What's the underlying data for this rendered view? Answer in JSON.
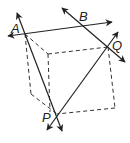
{
  "diagram": {
    "type": "geometry-cube-lines",
    "stroke_color": "#222222",
    "background": "#ffffff",
    "points": {
      "A": {
        "label": "A",
        "x": 25,
        "y": 34
      },
      "B": {
        "label": "B",
        "x": 80,
        "y": 27
      },
      "Q": {
        "label": "Q",
        "x": 108,
        "y": 47
      },
      "P": {
        "label": "P",
        "x": 57,
        "y": 114
      }
    },
    "lines": [
      {
        "name": "line-AB",
        "through": [
          "A",
          "B"
        ],
        "arrows": "both"
      },
      {
        "name": "line-BQ",
        "through": [
          "B",
          "Q"
        ],
        "arrows": "both"
      },
      {
        "name": "line-AP",
        "through": [
          "A",
          "P"
        ],
        "arrows": "both"
      },
      {
        "name": "line-PQ",
        "through": [
          "P",
          "Q"
        ],
        "arrows": "both"
      }
    ],
    "dashed_edges": "cube outline"
  }
}
